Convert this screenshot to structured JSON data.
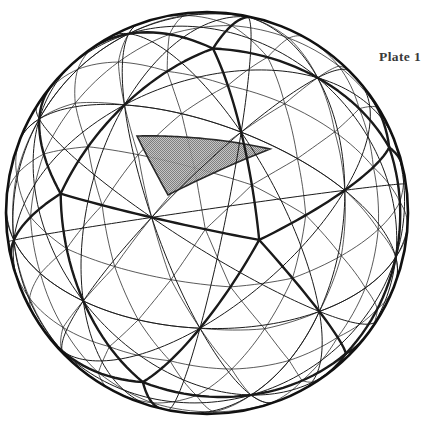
{
  "figure": {
    "title": "Plate 1",
    "caption_label": "Plate 1",
    "background_color": "#ffffff",
    "line_color": "#1a1a1a",
    "thin_line_color": "#3c3c3c",
    "outline_color": "#111111",
    "shaded_triangle_fill": "#a8a8a8",
    "shaded_triangle_stroke": "#2a2a2a"
  },
  "sphere": {
    "center_x": 207,
    "center_y": 213,
    "radius": 201,
    "frequency": 4,
    "base_polyhedron": "icosahedron",
    "view_rotation_x_deg": -22,
    "view_rotation_y_deg": 14,
    "view_rotation_z_deg": 8,
    "outline_width": 2.6,
    "major_edge_width": 2.4,
    "minor_edge_width": 0.85,
    "great_circle_width": 1.0
  },
  "shaded_triangle": {
    "name": "highlighted-spherical-triangle",
    "fill": "#a8a8a8",
    "opacity": 0.88,
    "vertices_px": [
      [
        137,
        136
      ],
      [
        183,
        137
      ],
      [
        270,
        149
      ],
      [
        168,
        195
      ]
    ]
  },
  "chart_data": {
    "type": "diagram",
    "title": "Plate 1",
    "geometry": "geodesic sphere, icosahedral class I, frequency 4",
    "elements": [
      "sphere outline circle",
      "icosahedral great-circle arcs (heavy lines)",
      "subdivided triangular grid (light lines)",
      "one shaded spherical triangle"
    ]
  }
}
